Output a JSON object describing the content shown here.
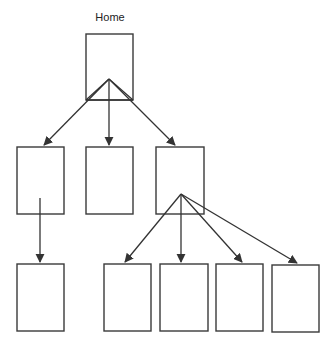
{
  "title": "Home",
  "colors": {
    "stroke": "#3a3a3a",
    "background": "#ffffff"
  },
  "nodes": [
    {
      "id": "home",
      "label": "Home",
      "x": 86,
      "y": 34,
      "w": 47,
      "h": 66
    },
    {
      "id": "m1",
      "label": "",
      "x": 17,
      "y": 147,
      "w": 47,
      "h": 67
    },
    {
      "id": "m2",
      "label": "",
      "x": 86,
      "y": 147,
      "w": 47,
      "h": 67
    },
    {
      "id": "m3",
      "label": "",
      "x": 156,
      "y": 147,
      "w": 48,
      "h": 67
    },
    {
      "id": "b1",
      "label": "",
      "x": 17,
      "y": 264,
      "w": 47,
      "h": 67
    },
    {
      "id": "b2",
      "label": "",
      "x": 104,
      "y": 264,
      "w": 47,
      "h": 67
    },
    {
      "id": "b3",
      "label": "",
      "x": 160,
      "y": 264,
      "w": 48,
      "h": 67
    },
    {
      "id": "b4",
      "label": "",
      "x": 216,
      "y": 264,
      "w": 47,
      "h": 67
    },
    {
      "id": "b5",
      "label": "",
      "x": 272,
      "y": 265,
      "w": 47,
      "h": 67
    }
  ],
  "edges": [
    {
      "from": "home",
      "to": "m1"
    },
    {
      "from": "home",
      "to": "m2"
    },
    {
      "from": "home",
      "to": "m3"
    },
    {
      "from": "m1",
      "to": "b1"
    },
    {
      "from": "m3",
      "to": "b2"
    },
    {
      "from": "m3",
      "to": "b3"
    },
    {
      "from": "m3",
      "to": "b4"
    },
    {
      "from": "m3",
      "to": "b5"
    }
  ]
}
